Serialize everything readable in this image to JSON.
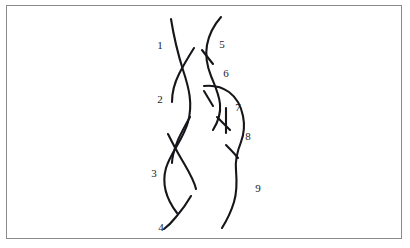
{
  "figure": {
    "kind": "knot-diagram",
    "background_color": "#ffffff",
    "frame": {
      "border_color": "#8a8a8a",
      "border_width_px": 1,
      "x": 6,
      "y": 5,
      "width": 396,
      "height": 234
    },
    "stroke_color": "#16161a",
    "label_color": "#1a1a1a",
    "arc_labels": [
      {
        "id": "arc-1",
        "text": "1",
        "x": 160,
        "y": 45
      },
      {
        "id": "arc-2",
        "text": "2",
        "x": 160,
        "y": 99
      },
      {
        "id": "arc-3",
        "text": "3",
        "x": 154,
        "y": 173
      },
      {
        "id": "arc-4",
        "text": "4",
        "x": 161,
        "y": 227
      },
      {
        "id": "arc-5",
        "text": "5",
        "x": 222,
        "y": 44
      },
      {
        "id": "arc-6",
        "text": "6",
        "x": 226,
        "y": 73
      },
      {
        "id": "arc-7",
        "text": "7",
        "x": 238,
        "y": 107
      },
      {
        "id": "arc-8",
        "text": "8",
        "x": 248,
        "y": 136
      },
      {
        "id": "arc-9",
        "text": "9",
        "x": 258,
        "y": 188
      }
    ],
    "crossings": [
      {
        "id": "crossing-1",
        "x": 181,
        "y": 66
      },
      {
        "id": "crossing-2",
        "x": 180,
        "y": 128
      },
      {
        "id": "crossing-3",
        "x": 181,
        "y": 210
      },
      {
        "id": "crossing-4",
        "x": 210,
        "y": 54
      },
      {
        "id": "crossing-5",
        "x": 212,
        "y": 88
      },
      {
        "id": "crossing-6",
        "x": 224,
        "y": 124
      },
      {
        "id": "crossing-7",
        "x": 232,
        "y": 151
      }
    ],
    "strands": {
      "left_a": "M 171 19 C 174 38, 178 54, 183 70 C 189 88, 193 104, 188 122 C 183 140, 171 152, 166 168 C 161 186, 167 200, 177 213",
      "left_b": "M 194 48 C 189 56, 184 64, 179 74 C 174 84, 172 92, 172 102",
      "left_c": "M 190 117 C 186 124, 182 131, 178 140 C 174 150, 172 156, 172 163",
      "left_d": "M 191 196 C 187 203, 182 210, 176 217 C 172 222, 168 226, 164 229",
      "left_e": "M 168 134 C 172 142, 176 150, 182 160 C 189 172, 194 180, 196 189",
      "left_f": "M 167 62 C 171 68, 175 74, 180 82 C 185 90, 188 96, 190 101",
      "right_a": "M 221 17 C 214 25, 209 34, 207 45 C 205 56, 207 66, 211 76 C 215 86, 219 94, 220 104 C 221 114, 218 122, 213 130",
      "right_b": "M 203 51 C 206 55, 209 59, 212 63",
      "right_c": "M 204 86 C 213 85, 222 87, 229 92 C 237 98, 241 106, 243 116 C 245 126, 244 134, 241 142 C 237 152, 235 160, 236 170 C 237 182, 237 192, 234 202 C 231 212, 227 220, 222 228",
      "right_d": "M 205 92 C 208 97, 210 101, 212 105",
      "right_e": "M 218 118 C 222 121, 226 125, 229 129",
      "right_f": "M 227 146 C 230 149, 234 153, 237 157"
    }
  }
}
